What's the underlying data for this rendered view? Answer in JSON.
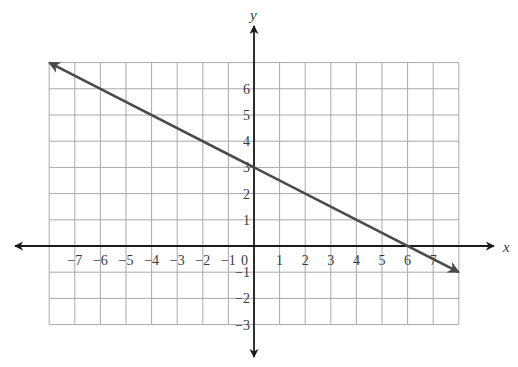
{
  "chart_data": {
    "type": "line",
    "title": "",
    "xlabel": "x",
    "ylabel": "y",
    "xlim": [
      -8,
      8
    ],
    "ylim": [
      -3,
      7
    ],
    "grid": true,
    "x_ticks": [
      "-7",
      "-6",
      "-5",
      "-4",
      "-3",
      "-2",
      "-1",
      "0",
      "1",
      "2",
      "3",
      "4",
      "5",
      "6",
      "7"
    ],
    "y_ticks": [
      "6",
      "5",
      "4",
      "3",
      "2",
      "1",
      "-1",
      "-2",
      "-3"
    ],
    "series": [
      {
        "name": "line",
        "equation": "y = -1/2 x + 3",
        "slope": -0.5,
        "intercept": 3,
        "x": [
          -8,
          8
        ],
        "y": [
          7,
          -1
        ],
        "arrows": "both"
      }
    ],
    "annotations": [
      {
        "label": "y-intercept",
        "x": 0,
        "y": 3
      },
      {
        "label": "x-intercept",
        "x": 6,
        "y": 0
      }
    ]
  },
  "colors": {
    "grid": "#a8a8a8",
    "axis": "#1a1a1a",
    "line": "#4a4a4a"
  }
}
